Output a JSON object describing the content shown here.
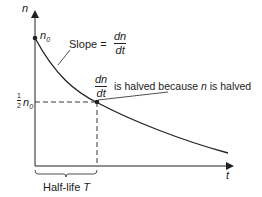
{
  "diagram": {
    "y_axis_label": "n",
    "x_axis_label": "t",
    "initial_label": "n",
    "initial_sub": "0",
    "half_label_num": "1",
    "half_label_den": "2",
    "half_label_var": "n",
    "half_label_sub": "0",
    "slope_prefix": "Slope =",
    "dn": "dn",
    "dt": "dt",
    "halved_text": "is halved because",
    "halved_var": "n",
    "halved_end": "is halved",
    "halflife_text": "Half-life",
    "halflife_var": "T"
  }
}
